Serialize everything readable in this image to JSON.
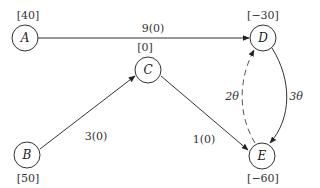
{
  "diagram": {
    "type": "network-flow",
    "nodes": [
      {
        "id": "A",
        "label": "A",
        "supply": "[40]",
        "x": 25,
        "y": 38
      },
      {
        "id": "B",
        "label": "B",
        "supply": "[50]",
        "x": 27,
        "y": 155
      },
      {
        "id": "C",
        "label": "C",
        "supply": "[0]",
        "x": 148,
        "y": 70
      },
      {
        "id": "D",
        "label": "D",
        "supply": "[−30]",
        "x": 263,
        "y": 38
      },
      {
        "id": "E",
        "label": "E",
        "supply": "[−60]",
        "x": 262,
        "y": 156
      }
    ],
    "edges": [
      {
        "from": "A",
        "to": "D",
        "label": "9(0)",
        "style": "solid"
      },
      {
        "from": "B",
        "to": "C",
        "label": "3(0)",
        "style": "solid"
      },
      {
        "from": "C",
        "to": "E",
        "label": "1(0)",
        "style": "solid"
      },
      {
        "from": "D",
        "to": "E",
        "label": "3θ",
        "style": "solid"
      },
      {
        "from": "E",
        "to": "D",
        "label": "2θ",
        "style": "dashed"
      }
    ]
  }
}
